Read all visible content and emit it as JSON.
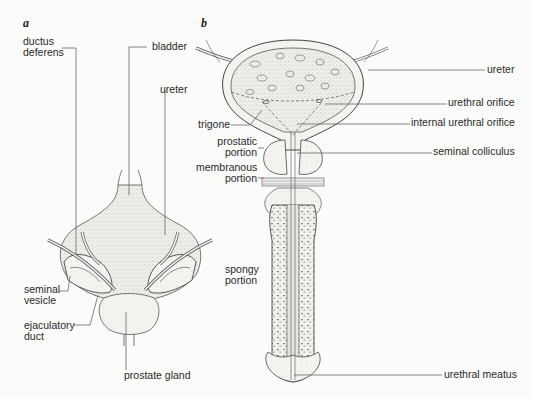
{
  "figure": {
    "panel_a": {
      "letter": "a",
      "labels": {
        "ductus_deferens_1": "ductus",
        "ductus_deferens_2": "deferens",
        "bladder": "bladder",
        "ureter": "ureter",
        "seminal_vesicle_1": "seminal",
        "seminal_vesicle_2": "vesicle",
        "ejaculatory_duct_1": "ejaculatory",
        "ejaculatory_duct_2": "duct",
        "prostate_gland": "prostate gland"
      }
    },
    "panel_b": {
      "letter": "b",
      "labels": {
        "ureter": "ureter",
        "urethral_orifice": "urethral orifice",
        "trigone": "trigone",
        "internal_urethral_orifice": "internal urethral orifice",
        "prostatic_portion_1": "prostatic",
        "prostatic_portion_2": "portion",
        "seminal_colliculus": "seminal colliculus",
        "membranous_portion_1": "membranous",
        "membranous_portion_2": "portion",
        "spongy_portion_1": "spongy",
        "spongy_portion_2": "portion",
        "urethral_meatus": "urethral meatus"
      }
    },
    "colors": {
      "line": "#555555",
      "tissue_fill": "#ecebe6",
      "stipple": "#9a9a94",
      "text": "#2a2a2a"
    }
  }
}
